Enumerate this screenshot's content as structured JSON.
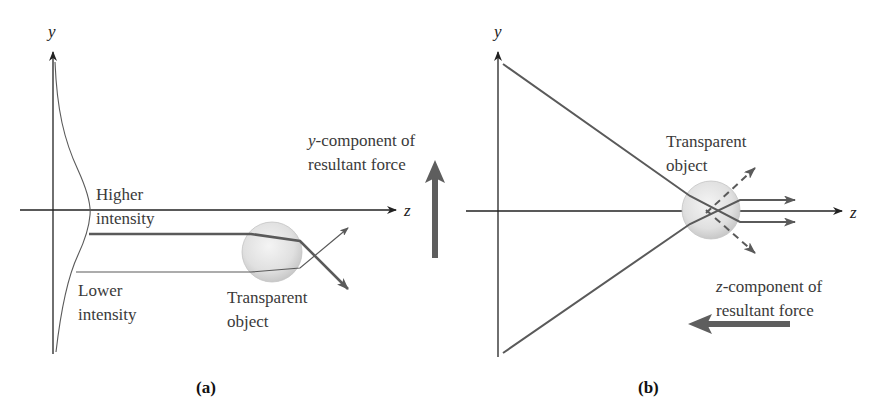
{
  "panels": [
    {
      "id": "a",
      "caption": "(a)",
      "axis_y_label": "y",
      "axis_z_label": "z",
      "labels": {
        "higher_1": "Higher",
        "higher_2": "intensity",
        "lower_1": "Lower",
        "lower_2": "intensity",
        "object_1": "Transparent",
        "object_2": "object",
        "force_1": "-component of",
        "force_1_var": "y",
        "force_2": "resultant force"
      }
    },
    {
      "id": "b",
      "caption": "(b)",
      "axis_y_label": "y",
      "axis_z_label": "z",
      "labels": {
        "object_1": "Transparent",
        "object_2": "object",
        "force_1": "-component of",
        "force_1_var": "z",
        "force_2": "resultant force"
      }
    }
  ],
  "colors": {
    "ray": "#5a5a5a",
    "axis": "#222222",
    "force_arrow": "#5e5e5e",
    "sphere": "#e2e2e2"
  }
}
